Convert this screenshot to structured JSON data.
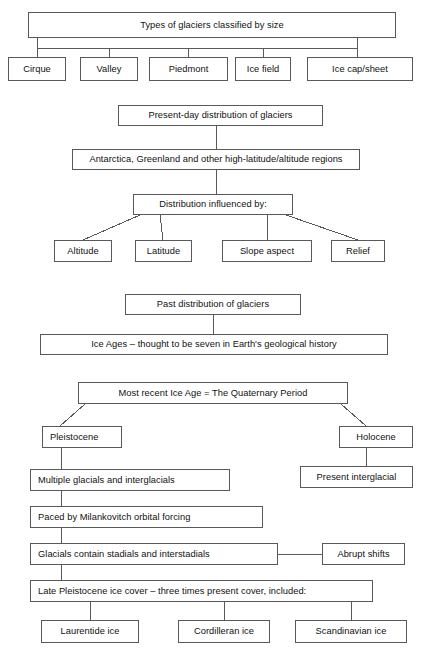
{
  "diagram": {
    "type": "flowchart",
    "title": "Types of glaciers classified by size",
    "width": 425,
    "height": 662,
    "box_border_color": "#58595b",
    "line_color": "#58595b",
    "text_color": "#111111",
    "background_color": "#ffffff"
  },
  "sections": {
    "classification": {
      "header": "Types of glaciers classified by size",
      "items": [
        "Cirque",
        "Valley",
        "Piedmont",
        "Ice field",
        "Ice cap/sheet"
      ]
    },
    "present_distribution": {
      "header": "Present-day distribution of glaciers",
      "regions": "Antarctica, Greenland and other high-latitude/altitude regions",
      "influence_header": "Distribution influenced by:",
      "influences": [
        "Altitude",
        "Latitude",
        "Slope aspect",
        "Relief"
      ]
    },
    "past_distribution": {
      "header": "Past distribution of glaciers",
      "ice_ages": "Ice Ages – thought to be seven in Earth's geological history"
    },
    "quaternary": {
      "header": "Most recent Ice Age = The Quaternary Period",
      "pleistocene": "Pleistocene",
      "holocene": "Holocene",
      "present_interglacial": "Present interglacial",
      "glacials_interglacials": "Multiple glacials and interglacials",
      "milankovitch": "Paced by Milankovitch orbital forcing",
      "stadials": "Glacials contain stadials and interstadials",
      "abrupt_shifts": "Abrupt shifts",
      "late_pleistocene": "Late Pleistocene ice cover – three times present cover, included:",
      "ice_sheets": [
        "Laurentide ice",
        "Cordilleran ice",
        "Scandinavian ice"
      ]
    }
  },
  "nodes": [
    {
      "key": "title",
      "bind": "sections.classification.header",
      "x": 28,
      "y": 12,
      "w": 368,
      "h": 26,
      "align": "center"
    },
    {
      "key": "cirque",
      "bind": "sections.classification.items.0",
      "x": 8,
      "y": 57,
      "w": 58,
      "h": 24,
      "align": "center"
    },
    {
      "key": "valley",
      "bind": "sections.classification.items.1",
      "x": 80,
      "y": 57,
      "w": 58,
      "h": 24,
      "align": "center"
    },
    {
      "key": "piedmont",
      "bind": "sections.classification.items.2",
      "x": 149,
      "y": 57,
      "w": 79,
      "h": 24,
      "align": "center"
    },
    {
      "key": "ice-field",
      "bind": "sections.classification.items.3",
      "x": 235,
      "y": 57,
      "w": 56,
      "h": 24,
      "align": "center"
    },
    {
      "key": "ice-cap-sheet",
      "bind": "sections.classification.items.4",
      "x": 307,
      "y": 57,
      "w": 106,
      "h": 24,
      "align": "center"
    },
    {
      "key": "present-day",
      "bind": "sections.present_distribution.header",
      "x": 118,
      "y": 105,
      "w": 205,
      "h": 21,
      "align": "center"
    },
    {
      "key": "regions",
      "bind": "sections.present_distribution.regions",
      "x": 72,
      "y": 149,
      "w": 288,
      "h": 21,
      "align": "center"
    },
    {
      "key": "influenced-by",
      "bind": "sections.present_distribution.influence_header",
      "x": 133,
      "y": 194,
      "w": 160,
      "h": 21,
      "align": "center"
    },
    {
      "key": "altitude",
      "bind": "sections.present_distribution.influences.0",
      "x": 54,
      "y": 240,
      "w": 58,
      "h": 22,
      "align": "center"
    },
    {
      "key": "latitude",
      "bind": "sections.present_distribution.influences.1",
      "x": 135,
      "y": 240,
      "w": 57,
      "h": 22,
      "align": "center"
    },
    {
      "key": "slope-aspect",
      "bind": "sections.present_distribution.influences.2",
      "x": 222,
      "y": 240,
      "w": 90,
      "h": 22,
      "align": "center"
    },
    {
      "key": "relief",
      "bind": "sections.present_distribution.influences.3",
      "x": 331,
      "y": 240,
      "w": 54,
      "h": 22,
      "align": "center"
    },
    {
      "key": "past-distribution",
      "bind": "sections.past_distribution.header",
      "x": 125,
      "y": 294,
      "w": 176,
      "h": 21,
      "align": "center"
    },
    {
      "key": "ice-ages",
      "bind": "sections.past_distribution.ice_ages",
      "x": 40,
      "y": 334,
      "w": 348,
      "h": 21,
      "align": "center"
    },
    {
      "key": "quaternary",
      "bind": "sections.quaternary.header",
      "x": 78,
      "y": 382,
      "w": 270,
      "h": 22,
      "align": "center"
    },
    {
      "key": "pleistocene",
      "bind": "sections.quaternary.pleistocene",
      "x": 42,
      "y": 426,
      "w": 80,
      "h": 22,
      "align": "left"
    },
    {
      "key": "holocene",
      "bind": "sections.quaternary.holocene",
      "x": 339,
      "y": 426,
      "w": 74,
      "h": 22,
      "align": "center"
    },
    {
      "key": "multiple-glacials",
      "bind": "sections.quaternary.glacials_interglacials",
      "x": 30,
      "y": 469,
      "w": 200,
      "h": 22,
      "align": "left"
    },
    {
      "key": "present-intergl",
      "bind": "sections.quaternary.present_interglacial",
      "x": 300,
      "y": 466,
      "w": 113,
      "h": 22,
      "align": "center"
    },
    {
      "key": "milankovitch",
      "bind": "sections.quaternary.milankovitch",
      "x": 30,
      "y": 506,
      "w": 233,
      "h": 22,
      "align": "left"
    },
    {
      "key": "stadials",
      "bind": "sections.quaternary.stadials",
      "x": 30,
      "y": 543,
      "w": 248,
      "h": 22,
      "align": "left"
    },
    {
      "key": "abrupt-shifts",
      "bind": "sections.quaternary.abrupt_shifts",
      "x": 322,
      "y": 543,
      "w": 83,
      "h": 22,
      "align": "center"
    },
    {
      "key": "late-pleistocene",
      "bind": "sections.quaternary.late_pleistocene",
      "x": 30,
      "y": 580,
      "w": 343,
      "h": 22,
      "align": "left"
    },
    {
      "key": "laurentide",
      "bind": "sections.quaternary.ice_sheets.0",
      "x": 41,
      "y": 620,
      "w": 98,
      "h": 23,
      "align": "center"
    },
    {
      "key": "cordilleran",
      "bind": "sections.quaternary.ice_sheets.1",
      "x": 178,
      "y": 620,
      "w": 92,
      "h": 23,
      "align": "center"
    },
    {
      "key": "scandinavian",
      "bind": "sections.quaternary.ice_sheets.2",
      "x": 295,
      "y": 620,
      "w": 112,
      "h": 23,
      "align": "center"
    }
  ],
  "connectors": [
    {
      "key": "title-bus",
      "points": [
        [
          37,
          38
        ],
        [
          37,
          48
        ],
        [
          357,
          48
        ],
        [
          357,
          38
        ]
      ]
    },
    {
      "key": "title-to-cirque",
      "points": [
        [
          37,
          48
        ],
        [
          37,
          57
        ]
      ]
    },
    {
      "key": "title-to-valley",
      "points": [
        [
          109,
          48
        ],
        [
          109,
          57
        ]
      ]
    },
    {
      "key": "title-to-piedmont",
      "points": [
        [
          188,
          48
        ],
        [
          188,
          57
        ]
      ]
    },
    {
      "key": "title-to-ice-field",
      "points": [
        [
          263,
          48
        ],
        [
          263,
          57
        ]
      ]
    },
    {
      "key": "title-to-ice-cap",
      "points": [
        [
          357,
          48
        ],
        [
          357,
          57
        ]
      ]
    },
    {
      "key": "present-to-regions",
      "points": [
        [
          216,
          126
        ],
        [
          216,
          149
        ]
      ]
    },
    {
      "key": "regions-to-influence",
      "points": [
        [
          216,
          170
        ],
        [
          216,
          194
        ]
      ]
    },
    {
      "key": "influence-to-altitude",
      "points": [
        [
          140,
          215
        ],
        [
          83,
          240
        ]
      ]
    },
    {
      "key": "influence-to-latitude",
      "points": [
        [
          160,
          215
        ],
        [
          163,
          240
        ]
      ]
    },
    {
      "key": "influence-to-slope",
      "points": [
        [
          267,
          215
        ],
        [
          267,
          240
        ]
      ]
    },
    {
      "key": "influence-to-relief",
      "points": [
        [
          286,
          215
        ],
        [
          358,
          240
        ]
      ]
    },
    {
      "key": "past-to-ice-ages",
      "points": [
        [
          213,
          315
        ],
        [
          213,
          334
        ]
      ]
    },
    {
      "key": "quat-to-pleistocene",
      "points": [
        [
          85,
          404
        ],
        [
          60,
          426
        ]
      ]
    },
    {
      "key": "quat-to-holocene",
      "points": [
        [
          341,
          404
        ],
        [
          366,
          426
        ]
      ]
    },
    {
      "key": "pleist-to-multiple",
      "points": [
        [
          61,
          448
        ],
        [
          61,
          469
        ]
      ]
    },
    {
      "key": "holo-to-present",
      "points": [
        [
          366,
          448
        ],
        [
          366,
          466
        ]
      ]
    },
    {
      "key": "multiple-to-milank",
      "points": [
        [
          61,
          491
        ],
        [
          61,
          506
        ]
      ]
    },
    {
      "key": "milank-to-stadials",
      "points": [
        [
          61,
          528
        ],
        [
          61,
          543
        ]
      ]
    },
    {
      "key": "stadials-to-abrupt",
      "points": [
        [
          278,
          554
        ],
        [
          322,
          554
        ]
      ]
    },
    {
      "key": "stadials-to-late",
      "points": [
        [
          61,
          565
        ],
        [
          61,
          580
        ]
      ]
    },
    {
      "key": "late-to-laurentide",
      "points": [
        [
          90,
          602
        ],
        [
          90,
          620
        ]
      ]
    },
    {
      "key": "late-to-cordilleran",
      "points": [
        [
          224,
          602
        ],
        [
          224,
          620
        ]
      ]
    },
    {
      "key": "late-to-scandinavian",
      "points": [
        [
          351,
          602
        ],
        [
          351,
          620
        ]
      ]
    }
  ]
}
